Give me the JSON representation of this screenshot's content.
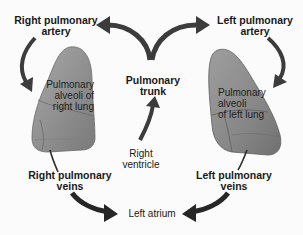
{
  "diagram": {
    "colors": {
      "arrow": "#3c3c3c",
      "lung_fill": "#8f8f8f",
      "lung_light": "#b5b5b5",
      "vessel": "#2e2e2e",
      "text": "#1a1a1a",
      "background": "#fbfbfb"
    },
    "labels": {
      "right_pulmonary_artery": {
        "line1": "Right pulmonary",
        "line2": "artery"
      },
      "left_pulmonary_artery": {
        "line1": "Left pulmonary",
        "line2": "artery"
      },
      "pulmonary_trunk": {
        "line1": "Pulmonary",
        "line2": "trunk"
      },
      "right_ventricle": {
        "line1": "Right",
        "line2": "ventricle"
      },
      "right_lung_alveoli": {
        "line1": "Pulmonary",
        "line2": "alveoli of",
        "line3": "right lung"
      },
      "left_lung_alveoli": {
        "line1": "Pulmonary",
        "line2": "alveoli",
        "line3": "of left lung"
      },
      "right_pulmonary_veins": {
        "line1": "Right pulmonary",
        "line2": "veins"
      },
      "left_pulmonary_veins": {
        "line1": "Left pulmonary",
        "line2": "veins"
      },
      "left_atrium": {
        "line1": "Left atrium"
      }
    },
    "flow": [
      "Right ventricle",
      "Pulmonary trunk",
      "Right pulmonary artery / Left pulmonary artery",
      "Pulmonary alveoli of right lung / Pulmonary alveoli of left lung",
      "Right pulmonary veins / Left pulmonary veins",
      "Left atrium"
    ]
  }
}
